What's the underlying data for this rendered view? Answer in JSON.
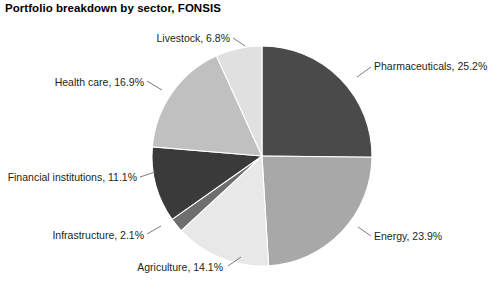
{
  "chart": {
    "title": "Portfolio breakdown by sector, FONSIS"
  },
  "chart_data": {
    "type": "pie",
    "title": "Portfolio breakdown by sector, FONSIS",
    "xlabel": "",
    "ylabel": "",
    "units": "percent",
    "start_angle_deg": 0,
    "direction": "clockwise",
    "legend": "none",
    "grid": false,
    "categories": [
      "Pharmaceuticals",
      "Energy",
      "Agriculture",
      "Infrastructure",
      "Financial institutions",
      "Health care",
      "Livestock"
    ],
    "values": [
      25.2,
      23.9,
      14.1,
      2.1,
      11.1,
      16.9,
      6.8
    ],
    "colors": [
      "#4a4a4a",
      "#a8a8a8",
      "#e8e8e8",
      "#6e6e6e",
      "#3a3a3a",
      "#c0c0c0",
      "#e0e0e0"
    ],
    "slices": [
      {
        "label": "Pharmaceuticals, 25.2%",
        "name": "Pharmaceuticals",
        "value": 25.2,
        "color": "#4a4a4a"
      },
      {
        "label": "Energy, 23.9%",
        "name": "Energy",
        "value": 23.9,
        "color": "#a8a8a8"
      },
      {
        "label": "Agriculture, 14.1%",
        "name": "Agriculture",
        "value": 14.1,
        "color": "#e8e8e8"
      },
      {
        "label": "Infrastructure, 2.1%",
        "name": "Infrastructure",
        "value": 2.1,
        "color": "#6e6e6e"
      },
      {
        "label": "Financial institutions, 11.1%",
        "name": "Financial institutions",
        "value": 11.1,
        "color": "#3a3a3a"
      },
      {
        "label": "Health care, 16.9%",
        "name": "Health care",
        "value": 16.9,
        "color": "#c0c0c0"
      },
      {
        "label": "Livestock, 6.8%",
        "name": "Livestock",
        "value": 6.8,
        "color": "#e0e0e0"
      }
    ]
  },
  "labels": {
    "pharmaceuticals": "Pharmaceuticals, 25.2%",
    "energy": "Energy, 23.9%",
    "agriculture": "Agriculture, 14.1%",
    "infrastructure": "Infrastructure, 2.1%",
    "financial_institutions": "Financial institutions, 11.1%",
    "health_care": "Health care, 16.9%",
    "livestock": "Livestock, 6.8%"
  }
}
